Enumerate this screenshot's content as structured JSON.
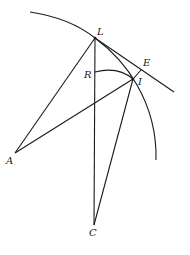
{
  "diagram": {
    "type": "geometric-construction",
    "labels": {
      "L": "L",
      "E": "E",
      "R": "R",
      "I": "I",
      "A": "A",
      "C": "C"
    },
    "points": {
      "L": [
        95,
        38
      ],
      "E": [
        141,
        70
      ],
      "R": [
        95,
        72
      ],
      "I": [
        133,
        79
      ],
      "A": [
        15,
        153
      ],
      "C": [
        94,
        225
      ]
    },
    "segments": [
      [
        "L",
        "A"
      ],
      [
        "L",
        "C"
      ],
      [
        "A",
        "I"
      ],
      [
        "I",
        "C"
      ],
      [
        "I",
        "E"
      ]
    ],
    "curves": [
      {
        "name": "outer-arc",
        "through": [
          "L",
          "I"
        ]
      },
      {
        "name": "inner-arc",
        "from": "R",
        "to": "I"
      }
    ],
    "tangent_line": {
      "from": "L",
      "through": "E"
    },
    "stroke_color": "#1a1a1a",
    "background": "#ffffff"
  }
}
